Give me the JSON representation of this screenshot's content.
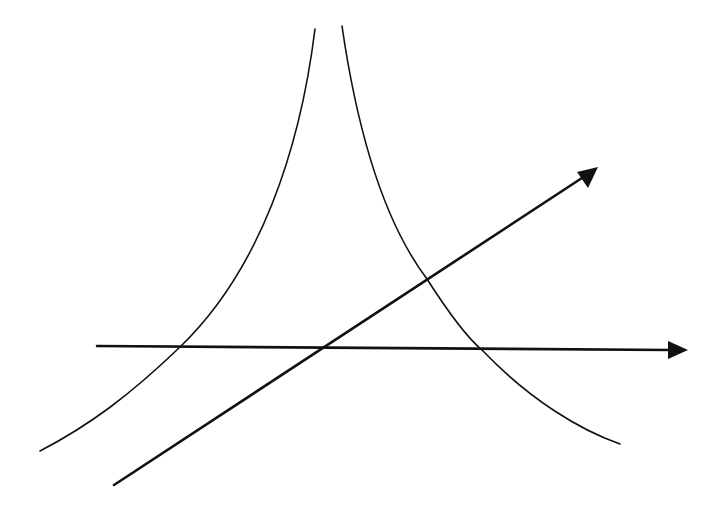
{
  "diagram": {
    "colors": {
      "background": "#ffffff",
      "stroke": "#111111"
    },
    "curves": [
      {
        "name": "left-curve",
        "path": "M 315 29 C 300 150, 260 270, 180 347 C 130 395, 90 425, 40 451"
      },
      {
        "name": "right-curve",
        "path": "M 342 26 C 360 150, 390 230, 427 279 C 450 315, 470 340, 482 350 C 530 400, 580 430, 620 444"
      }
    ],
    "arrows": [
      {
        "name": "horizontal-arrow",
        "x1": 97,
        "y1": 346,
        "x2": 670,
        "y2": 350,
        "head": "688,350 668,341 668,359"
      },
      {
        "name": "diagonal-arrow",
        "x1": 114,
        "y1": 485,
        "x2": 585,
        "y2": 176,
        "head": "598,167 577,172 588,188"
      }
    ],
    "labels": []
  }
}
